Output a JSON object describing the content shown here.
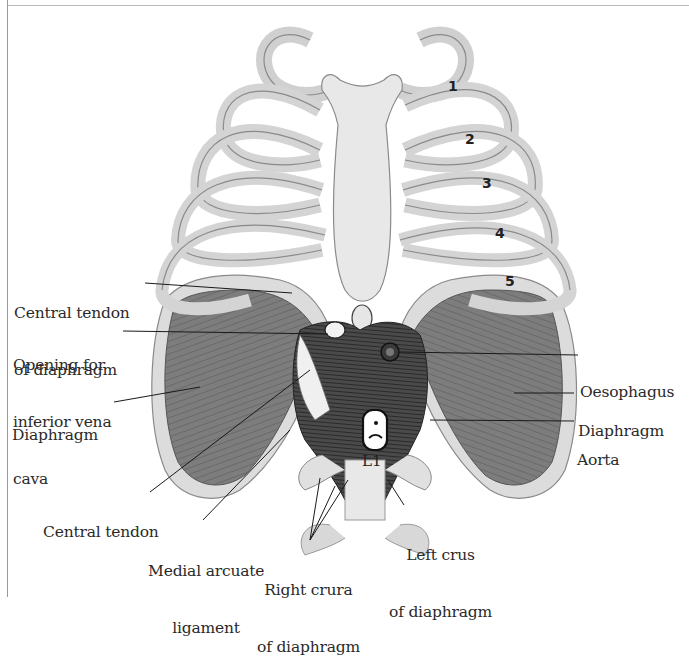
{
  "figure": {
    "colors": {
      "bone": "#d9d9d9",
      "bone_outline": "#8a8a8a",
      "muscle": "#7a7a7a",
      "muscle_dark": "#3a3a3a",
      "label_text": "#2a2a2a",
      "leader_line": "#1a1a1a"
    },
    "rib_numbers": [
      "1",
      "2",
      "3",
      "4",
      "5"
    ],
    "vertebra_label": "L1",
    "labels_left": [
      {
        "line1": "Central tendon",
        "line2": "of diaphragm"
      },
      {
        "line1": "Opening for",
        "line2": "inferior vena",
        "line3": "cava"
      },
      {
        "line1": "Diaphragm"
      }
    ],
    "labels_right": [
      {
        "line1": "Oesophagus"
      },
      {
        "line1": "Diaphragm"
      },
      {
        "line1": "Aorta"
      }
    ],
    "labels_bottom": [
      {
        "line1": "Central tendon"
      },
      {
        "line1": "Medial arcuate",
        "line2": "ligament"
      },
      {
        "line1": "Right crura",
        "line2": "of diaphragm"
      },
      {
        "line1": "Left crus",
        "line2": "of diaphragm"
      }
    ]
  }
}
